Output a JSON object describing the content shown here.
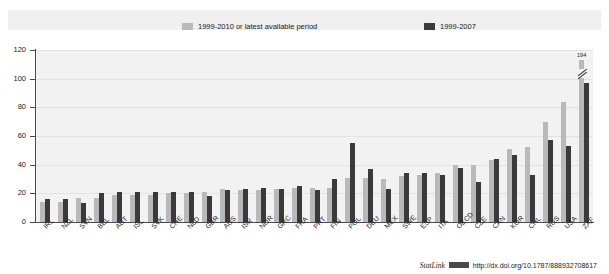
{
  "legend": {
    "items": [
      {
        "label": "1999-2010 or latest available period",
        "color": "#b9b9b9",
        "swatch": "light-grey-swatch"
      },
      {
        "label": "1999-2007",
        "color": "#3a3a3a",
        "swatch": "dark-grey-swatch"
      }
    ]
  },
  "footer": {
    "statlink_label": "StatLink",
    "statlink_icon": "statlink-barcode-icon",
    "url": "http://dx.doi.org/10.1787/888932708617"
  },
  "chart_data": {
    "type": "bar",
    "title": "",
    "xlabel": "",
    "ylabel": "",
    "ylim": [
      0,
      120
    ],
    "yticks": [
      0,
      20,
      40,
      60,
      80,
      100,
      120
    ],
    "ytick_labels": [
      "0",
      "20",
      "40",
      "60",
      "80",
      "100",
      "120"
    ],
    "grid": true,
    "legend_position": "top",
    "categories": [
      "IRL",
      "NZL",
      "SVN",
      "BEL",
      "AUT",
      "ISL",
      "SVK",
      "CHE",
      "NLD",
      "GBR",
      "AUS",
      "ISR",
      "NOR",
      "GRC",
      "FRA",
      "PRT",
      "FIN",
      "POL",
      "DEU",
      "MEX",
      "SWE",
      "ESP",
      "ITA",
      "OECD",
      "CZE",
      "CAN",
      "KOR",
      "CHL",
      "RUS",
      "USA",
      "ZAF"
    ],
    "series": [
      {
        "name": "1999-2010 or latest available period",
        "color": "#b9b9b9",
        "values": [
          14,
          14,
          17,
          17,
          19,
          19,
          19,
          20,
          20,
          21,
          23,
          22,
          22,
          23,
          24,
          24,
          24,
          31,
          31,
          30,
          32,
          33,
          34,
          40,
          40,
          43,
          51,
          52,
          70,
          84,
          113
        ]
      },
      {
        "name": "1999-2007",
        "color": "#3a3a3a",
        "values": [
          16,
          16,
          13,
          20,
          21,
          21,
          21,
          21,
          21,
          18,
          22,
          23,
          24,
          23,
          25,
          22,
          30,
          55,
          37,
          23,
          34,
          34,
          33,
          38,
          28,
          44,
          47,
          33,
          57,
          53,
          97
        ]
      }
    ],
    "annotations": [
      {
        "category": "ZAF",
        "series": "1999-2010 or latest available period",
        "value_label": "194",
        "axis_break": true
      }
    ]
  }
}
